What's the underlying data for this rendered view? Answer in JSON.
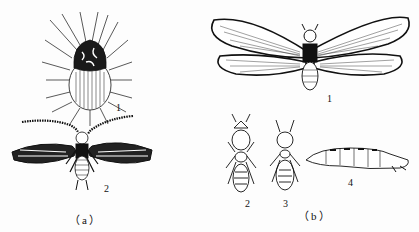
{
  "figure": {
    "panels": [
      {
        "caption": "（a）",
        "items": [
          {
            "number": "1",
            "subject": "round hairy insect (dorsal view)"
          },
          {
            "number": "2",
            "subject": "winged insect with feathered antennae and banded wings"
          }
        ]
      },
      {
        "caption": "（b）",
        "items": [
          {
            "number": "1",
            "subject": "winged adult with four long veined wings"
          },
          {
            "number": "2",
            "subject": "wingless caste, large head"
          },
          {
            "number": "3",
            "subject": "wingless caste, smaller head"
          },
          {
            "number": "4",
            "subject": "elongated larva-like form, side view"
          }
        ]
      }
    ],
    "colors": {
      "ink": "#111111",
      "background": "#fdfdfd"
    }
  }
}
